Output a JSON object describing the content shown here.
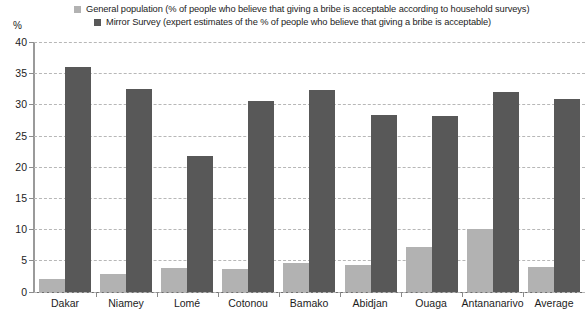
{
  "legend": {
    "series": [
      {
        "label": "General population (% of people who believe that giving a bribe is acceptable according to household surveys)",
        "color": "#b2b2b2",
        "swatch_icon": "square-swatch-icon"
      },
      {
        "label": "Mirror Survey (expert estimates of the % of people who believe that giving a bribe is acceptable)",
        "color": "#585858",
        "swatch_icon": "square-swatch-icon"
      }
    ]
  },
  "axes": {
    "y_unit_label": "%",
    "y_tick_labels": [
      "40",
      "35",
      "30",
      "25",
      "20",
      "15",
      "10",
      "5",
      "0"
    ],
    "x_tick_labels": [
      "Dakar",
      "Niamey",
      "Lomé",
      "Cotonou",
      "Bamako",
      "Abidjan",
      "Ouaga",
      "Antananarivo",
      "Average"
    ]
  },
  "chart_data": {
    "type": "bar",
    "title": "",
    "xlabel": "",
    "ylabel": "%",
    "ylim": [
      0,
      40
    ],
    "yticks": [
      0,
      5,
      10,
      15,
      20,
      25,
      30,
      35,
      40
    ],
    "grid": true,
    "legend_position": "top",
    "categories": [
      "Dakar",
      "Niamey",
      "Lomé",
      "Cotonou",
      "Bamako",
      "Abidjan",
      "Ouaga",
      "Antananarivo",
      "Average"
    ],
    "series": [
      {
        "name": "General population (% of people who believe that giving a bribe is acceptable according to household surveys)",
        "color": "#b2b2b2",
        "values": [
          2.0,
          2.8,
          3.7,
          3.6,
          4.5,
          4.3,
          7.2,
          10.0,
          3.9
        ]
      },
      {
        "name": "Mirror Survey (expert estimates of the % of people who believe that giving a bribe is acceptable)",
        "color": "#585858",
        "values": [
          36.0,
          32.5,
          21.7,
          30.5,
          32.3,
          28.3,
          28.1,
          32.0,
          30.8
        ]
      }
    ]
  }
}
